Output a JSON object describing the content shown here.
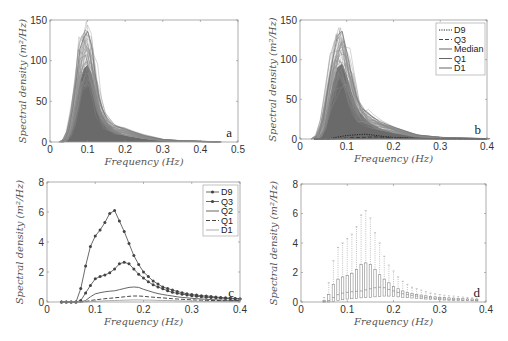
{
  "figure": {
    "panels": [
      "a",
      "b",
      "c",
      "d"
    ]
  },
  "chart_data": [
    {
      "panel": "a",
      "type": "area",
      "title": "",
      "xlabel": "Frequency (Hz)",
      "ylabel": "Spectral density (m²/Hz)",
      "xlim": [
        0,
        0.5
      ],
      "ylim": [
        0,
        150
      ],
      "xticks": [
        "0",
        "0.1",
        "0.2",
        "0.3",
        "0.4",
        "0.5"
      ],
      "yticks": [
        "0",
        "50",
        "100",
        "150"
      ],
      "grid": false,
      "description": "Overlaid spectra of many records (dark grey fill), peak near 0.1 Hz",
      "envelope": {
        "x": [
          0.03,
          0.04,
          0.05,
          0.06,
          0.07,
          0.08,
          0.09,
          0.1,
          0.11,
          0.12,
          0.13,
          0.14,
          0.15,
          0.17,
          0.2,
          0.25,
          0.3,
          0.35,
          0.4,
          0.45
        ],
        "max": [
          0,
          3,
          15,
          40,
          75,
          115,
          128,
          136,
          120,
          85,
          55,
          40,
          30,
          20,
          16,
          8,
          3,
          1.5,
          0.8,
          0.3
        ],
        "typical": [
          0,
          1,
          8,
          25,
          50,
          75,
          90,
          95,
          85,
          65,
          45,
          33,
          25,
          15,
          8,
          4,
          2,
          1,
          0.5,
          0.2
        ]
      },
      "annotation": "a"
    },
    {
      "panel": "b",
      "type": "area",
      "title": "",
      "xlabel": "Frequency (Hz)",
      "ylabel": "Spectral density (m²/Hz)",
      "xlim": [
        0,
        0.4
      ],
      "ylim": [
        0,
        150
      ],
      "xticks": [
        "0",
        "0.1",
        "0.2",
        "0.3",
        "0.4"
      ],
      "yticks": [
        "0",
        "50",
        "100",
        "150"
      ],
      "grid": false,
      "legend": [
        "D9",
        "Q3",
        "Median",
        "Q1",
        "D1"
      ],
      "legend_position": "upper right",
      "envelope": {
        "x": [
          0.03,
          0.04,
          0.05,
          0.06,
          0.07,
          0.08,
          0.09,
          0.1,
          0.11,
          0.12,
          0.13,
          0.14,
          0.15,
          0.17,
          0.2,
          0.25,
          0.3,
          0.35,
          0.4
        ],
        "max": [
          0,
          5,
          25,
          65,
          100,
          130,
          136,
          110,
          80,
          55,
          40,
          35,
          30,
          22,
          15,
          5,
          2,
          1,
          0.5
        ],
        "typical": [
          0,
          2,
          12,
          40,
          70,
          90,
          95,
          80,
          60,
          42,
          32,
          26,
          20,
          14,
          8,
          3,
          1,
          0.5,
          0.2
        ]
      },
      "series": [
        {
          "name": "D9",
          "style": "dotted",
          "x": [
            0.03,
            0.06,
            0.08,
            0.1,
            0.12,
            0.14,
            0.16,
            0.18,
            0.2,
            0.25,
            0.3,
            0.35,
            0.4
          ],
          "values": [
            0,
            0,
            2.4,
            4.4,
            5.3,
            6.1,
            4.7,
            3.1,
            2.0,
            0.9,
            0.5,
            0.33,
            0.22
          ]
        },
        {
          "name": "Q3",
          "style": "dashed",
          "x": [
            0.03,
            0.06,
            0.08,
            0.1,
            0.12,
            0.14,
            0.16,
            0.18,
            0.2,
            0.25,
            0.3,
            0.35,
            0.4
          ],
          "values": [
            0,
            0,
            0.6,
            1.55,
            1.8,
            2.2,
            2.65,
            2.2,
            1.6,
            0.75,
            0.42,
            0.28,
            0.2
          ]
        },
        {
          "name": "Median",
          "style": "solid",
          "x": [
            0.03,
            0.06,
            0.08,
            0.1,
            0.12,
            0.14,
            0.16,
            0.18,
            0.2,
            0.25,
            0.3,
            0.35,
            0.4
          ],
          "values": [
            0,
            0,
            0.2,
            0.55,
            0.68,
            0.75,
            0.9,
            1.0,
            0.85,
            0.45,
            0.25,
            0.15,
            0.1
          ]
        },
        {
          "name": "Q1",
          "style": "solid",
          "x": [
            0.03,
            0.06,
            0.08,
            0.1,
            0.12,
            0.14,
            0.16,
            0.18,
            0.2,
            0.25,
            0.3,
            0.35,
            0.4
          ],
          "values": [
            0,
            0,
            0.05,
            0.15,
            0.22,
            0.28,
            0.35,
            0.4,
            0.38,
            0.25,
            0.15,
            0.1,
            0.06
          ]
        },
        {
          "name": "D1",
          "style": "solid",
          "x": [
            0.03,
            0.06,
            0.08,
            0.1,
            0.12,
            0.14,
            0.16,
            0.18,
            0.2,
            0.25,
            0.3,
            0.35,
            0.4
          ],
          "values": [
            0,
            0,
            0.02,
            0.05,
            0.08,
            0.1,
            0.12,
            0.14,
            0.13,
            0.1,
            0.06,
            0.04,
            0.03
          ]
        }
      ],
      "annotation": "b"
    },
    {
      "panel": "c",
      "type": "line",
      "title": "",
      "xlabel": "Frequency (Hz)",
      "ylabel": "Spectral density (m²/Hz)",
      "xlim": [
        0,
        0.4
      ],
      "ylim": [
        0,
        8
      ],
      "xticks": [
        "0",
        "0.1",
        "0.2",
        "0.3",
        "0.4"
      ],
      "yticks": [
        "0",
        "2",
        "4",
        "6",
        "8"
      ],
      "grid": false,
      "legend": [
        "D9",
        "Q3",
        "Q2",
        "Q1",
        "D1"
      ],
      "legend_position": "upper right",
      "x": [
        0.03,
        0.04,
        0.05,
        0.06,
        0.07,
        0.08,
        0.09,
        0.1,
        0.11,
        0.12,
        0.13,
        0.14,
        0.15,
        0.16,
        0.17,
        0.18,
        0.19,
        0.2,
        0.21,
        0.22,
        0.23,
        0.24,
        0.25,
        0.26,
        0.27,
        0.28,
        0.29,
        0.3,
        0.31,
        0.32,
        0.33,
        0.34,
        0.35,
        0.36,
        0.37,
        0.38,
        0.39,
        0.4
      ],
      "series": [
        {
          "name": "D9",
          "style": "solid-marker",
          "values": [
            0,
            0,
            0,
            0,
            0.9,
            2.4,
            3.7,
            4.4,
            4.8,
            5.3,
            5.9,
            6.1,
            5.4,
            4.7,
            3.9,
            3.1,
            2.5,
            2.0,
            1.7,
            1.4,
            1.2,
            1.0,
            0.9,
            0.8,
            0.7,
            0.62,
            0.55,
            0.5,
            0.46,
            0.42,
            0.4,
            0.37,
            0.33,
            0.3,
            0.28,
            0.26,
            0.24,
            0.22
          ]
        },
        {
          "name": "Q3",
          "style": "solid-marker",
          "values": [
            0,
            0,
            0,
            0,
            0.1,
            0.6,
            1.1,
            1.55,
            1.7,
            1.8,
            1.95,
            2.2,
            2.55,
            2.65,
            2.55,
            2.2,
            1.85,
            1.6,
            1.35,
            1.15,
            1.0,
            0.88,
            0.75,
            0.65,
            0.58,
            0.52,
            0.47,
            0.42,
            0.38,
            0.35,
            0.32,
            0.3,
            0.28,
            0.26,
            0.24,
            0.22,
            0.21,
            0.2
          ]
        },
        {
          "name": "Q2",
          "style": "solid",
          "values": [
            0,
            0,
            0,
            0,
            0,
            0.1,
            0.35,
            0.55,
            0.62,
            0.68,
            0.72,
            0.75,
            0.82,
            0.9,
            0.97,
            1.0,
            0.97,
            0.85,
            0.75,
            0.65,
            0.56,
            0.5,
            0.45,
            0.4,
            0.35,
            0.31,
            0.28,
            0.25,
            0.22,
            0.2,
            0.18,
            0.16,
            0.15,
            0.13,
            0.12,
            0.11,
            0.1,
            0.1
          ]
        },
        {
          "name": "Q1",
          "style": "dashed",
          "values": [
            0,
            0,
            0,
            0,
            0,
            0.03,
            0.1,
            0.15,
            0.18,
            0.22,
            0.25,
            0.28,
            0.31,
            0.35,
            0.38,
            0.4,
            0.4,
            0.38,
            0.35,
            0.32,
            0.29,
            0.27,
            0.25,
            0.22,
            0.2,
            0.18,
            0.16,
            0.15,
            0.13,
            0.12,
            0.11,
            0.1,
            0.1,
            0.09,
            0.08,
            0.07,
            0.07,
            0.06
          ]
        },
        {
          "name": "D1",
          "style": "solid-light",
          "values": [
            0,
            0,
            0,
            0,
            0,
            0.01,
            0.03,
            0.05,
            0.06,
            0.08,
            0.09,
            0.1,
            0.11,
            0.12,
            0.13,
            0.14,
            0.14,
            0.13,
            0.13,
            0.12,
            0.11,
            0.1,
            0.1,
            0.09,
            0.08,
            0.07,
            0.06,
            0.06,
            0.05,
            0.05,
            0.04,
            0.04,
            0.04,
            0.03,
            0.03,
            0.03,
            0.03,
            0.03
          ]
        }
      ],
      "annotation": "c"
    },
    {
      "panel": "d",
      "type": "box",
      "title": "",
      "xlabel": "Frequency (Hz)",
      "ylabel": "Spectral density (m²/Hz)",
      "xlim": [
        0,
        0.4
      ],
      "ylim": [
        0,
        8
      ],
      "xticks": [
        "0",
        "0.1",
        "0.2",
        "0.3",
        "0.4"
      ],
      "yticks": [
        "0",
        "2",
        "4",
        "6",
        "8"
      ],
      "grid": false,
      "x": [
        0.05,
        0.06,
        0.07,
        0.08,
        0.09,
        0.1,
        0.11,
        0.12,
        0.13,
        0.14,
        0.15,
        0.16,
        0.17,
        0.18,
        0.19,
        0.2,
        0.21,
        0.22,
        0.23,
        0.24,
        0.25,
        0.26,
        0.27,
        0.28,
        0.29,
        0.3,
        0.31,
        0.32,
        0.33,
        0.34,
        0.35,
        0.36,
        0.37,
        0.38
      ],
      "q1": [
        0,
        0,
        0.05,
        0.1,
        0.15,
        0.2,
        0.22,
        0.25,
        0.28,
        0.3,
        0.32,
        0.35,
        0.38,
        0.4,
        0.4,
        0.38,
        0.35,
        0.32,
        0.29,
        0.27,
        0.25,
        0.22,
        0.2,
        0.18,
        0.16,
        0.15,
        0.13,
        0.12,
        0.11,
        0.1,
        0.1,
        0.09,
        0.08,
        0.07
      ],
      "q3": [
        0.1,
        0.5,
        1.2,
        1.55,
        1.7,
        1.8,
        1.95,
        2.2,
        2.55,
        2.65,
        2.55,
        2.2,
        1.85,
        1.55,
        1.3,
        1.05,
        0.9,
        0.75,
        0.65,
        0.58,
        0.52,
        0.47,
        0.42,
        0.38,
        0.35,
        0.32,
        0.3,
        0.28,
        0.26,
        0.24,
        0.22,
        0.21,
        0.2,
        0.18
      ],
      "whisker_high": [
        0.3,
        1.3,
        2.8,
        3.7,
        4.0,
        4.3,
        4.6,
        5.1,
        5.9,
        6.2,
        5.7,
        4.7,
        4.0,
        3.1,
        2.5,
        2.1,
        1.7,
        1.4,
        1.2,
        1.0,
        0.9,
        0.8,
        0.7,
        0.6,
        0.55,
        0.5,
        0.46,
        0.42,
        0.4,
        0.37,
        0.33,
        0.3,
        0.28,
        0.26
      ],
      "median": [
        0.02,
        0.1,
        0.3,
        0.5,
        0.6,
        0.65,
        0.7,
        0.72,
        0.75,
        0.82,
        0.9,
        0.97,
        1.0,
        0.97,
        0.85,
        0.75,
        0.65,
        0.56,
        0.5,
        0.45,
        0.4,
        0.35,
        0.31,
        0.28,
        0.25,
        0.22,
        0.2,
        0.18,
        0.16,
        0.15,
        0.13,
        0.12,
        0.11,
        0.1
      ],
      "annotation": "d"
    }
  ]
}
